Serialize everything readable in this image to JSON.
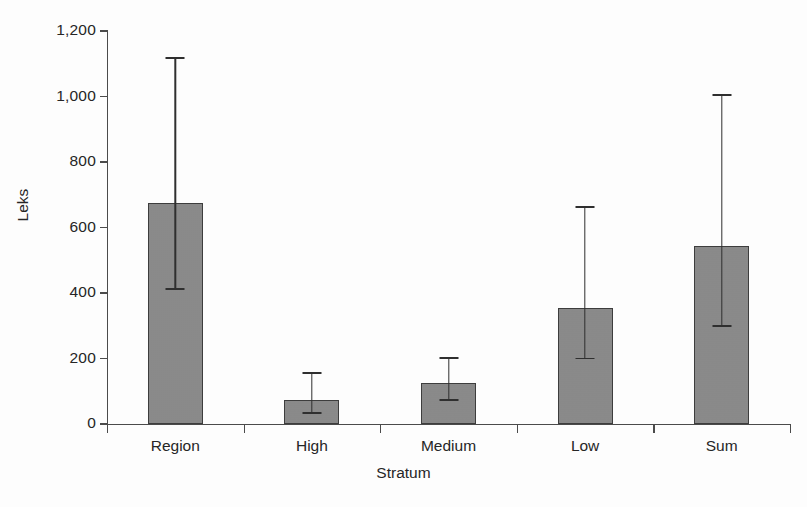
{
  "chart_data": {
    "type": "bar",
    "title": "",
    "xlabel": "Stratum",
    "ylabel": "Leks",
    "categories": [
      "Region",
      "High",
      "Medium",
      "Low",
      "Sum"
    ],
    "values": [
      675,
      73,
      125,
      353,
      543
    ],
    "error_low": [
      413,
      33,
      73,
      200,
      300
    ],
    "error_high": [
      1118,
      155,
      202,
      663,
      1005
    ],
    "series": [
      {
        "name": "Leks",
        "values": [
          675,
          73,
          125,
          353,
          543
        ]
      }
    ],
    "ylim": [
      0,
      1200
    ],
    "yticks": [
      0,
      200,
      400,
      600,
      800,
      1000,
      1200
    ],
    "ytick_labels": [
      "0",
      "200",
      "400",
      "600",
      "800",
      "1,000",
      "1,200"
    ],
    "grid": false,
    "legend": "none",
    "bar_color": "#8b8b8b",
    "bar_edge_color": "#3d3d3d",
    "error_bar_color": "#2f2f2f",
    "background_color": "#fdfdfd",
    "axis_color": "#4b4b4b",
    "text_color": "#262626"
  }
}
